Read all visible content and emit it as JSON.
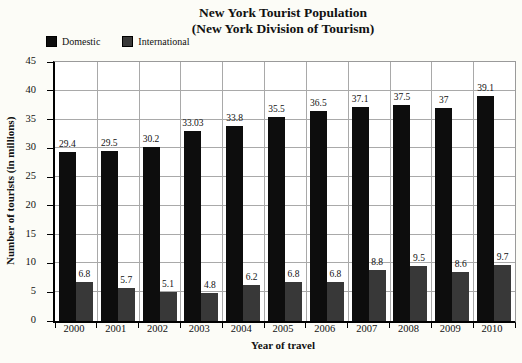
{
  "title": {
    "line1": "New York Tourist Population",
    "line2": "(New York Division of Tourism)"
  },
  "legend": [
    {
      "label": "Domestic",
      "color": "#0d0d0d"
    },
    {
      "label": "International",
      "color": "#383838"
    }
  ],
  "chart_data": {
    "type": "bar",
    "title": "New York Tourist Population (New York Division of Tourism)",
    "categories": [
      "2000",
      "2001",
      "2002",
      "2003",
      "2004",
      "2005",
      "2006",
      "2007",
      "2008",
      "2009",
      "2010"
    ],
    "series": [
      {
        "name": "Domestic",
        "color": "#0d0d0d",
        "values": [
          29.4,
          29.5,
          30.2,
          33.03,
          33.8,
          35.5,
          36.5,
          37.1,
          37.5,
          37,
          39.1
        ],
        "labels": [
          "29.4",
          "29.5",
          "30.2",
          "33.03",
          "33.8",
          "35.5",
          "36.5",
          "37.1",
          "37.5",
          "37",
          "39.1"
        ]
      },
      {
        "name": "International",
        "color": "#383838",
        "values": [
          6.8,
          5.7,
          5.1,
          4.8,
          6.2,
          6.8,
          6.8,
          8.8,
          9.5,
          8.6,
          9.7
        ],
        "labels": [
          "6.8",
          "5.7",
          "5.1",
          "4.8",
          "6.2",
          "6.8",
          "6.8",
          "8.8",
          "9.5",
          "8.6",
          "9.7"
        ]
      }
    ],
    "xlabel": "Year of travel",
    "ylabel": "Number of tourists (in millions)",
    "ylim": [
      0,
      45
    ],
    "ytick_step": 5,
    "grid": true,
    "legend_position": "top-left"
  }
}
